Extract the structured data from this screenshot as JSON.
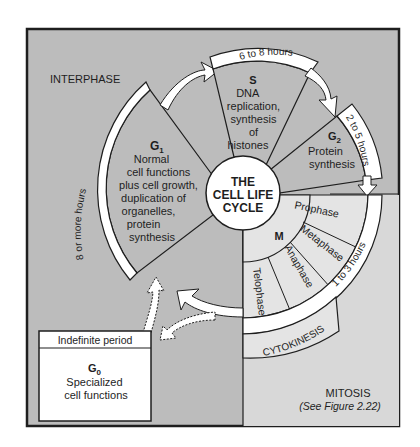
{
  "diagram": {
    "title_lines": [
      "THE",
      "CELL LIFE",
      "CYCLE"
    ],
    "regions": {
      "interphase_label": "INTERPHASE",
      "mitosis_label": "MITOSIS",
      "mitosis_ref": "(See Figure 2.22)"
    },
    "phases": {
      "g1": {
        "name": "G",
        "sub": "1",
        "lines": [
          "Normal",
          "cell functions",
          "plus cell growth,",
          "duplication of",
          "organelles,",
          "protein",
          "synthesis"
        ],
        "duration": "8 or more hours"
      },
      "s": {
        "name": "S",
        "lines": [
          "DNA",
          "replication,",
          "synthesis",
          "of",
          "histones"
        ],
        "duration": "6 to 8 hours"
      },
      "g2": {
        "name": "G",
        "sub": "2",
        "lines": [
          "Protein",
          "synthesis"
        ],
        "duration": "2 to 5 hours"
      },
      "m": {
        "name": "M",
        "stages": [
          "Prophase",
          "Metaphase",
          "Anaphase",
          "Telophase"
        ],
        "duration": "1 to 3 hours",
        "cytokinesis": "CYTOKINESIS"
      },
      "g0": {
        "header": "Indefinite period",
        "name": "G",
        "sub": "0",
        "lines": [
          "Specialized",
          "cell functions"
        ]
      }
    },
    "colors": {
      "interphase_bg": "#bcbcbc",
      "mitosis_bg": "#d8d8d8",
      "stage_fill": "#e4e4e4",
      "band_fill": "#ffffff",
      "stroke": "#1e1e1e"
    }
  }
}
